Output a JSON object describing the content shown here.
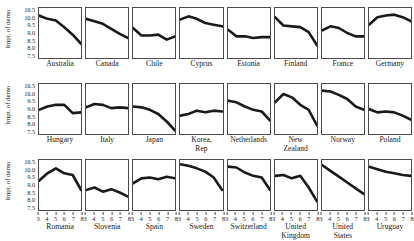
{
  "figure": {
    "axis": {
      "ylabel": "Impt. of demo",
      "ytick_labels": [
        "10.5",
        "10.0",
        "9.5",
        "9.0",
        "8.5",
        "8.0",
        "7.5"
      ],
      "yrange": [
        7.5,
        10.5
      ],
      "xtick_labels": [
        "3",
        "4",
        "5",
        "6",
        "7",
        "8"
      ],
      "xrange": [
        3,
        8
      ],
      "line_color": "#1a1a1a",
      "frame_color": "#4a4a4a"
    }
  },
  "chart_data": {
    "type": "line",
    "title": "",
    "xlabel": "",
    "ylabel": "Impt. of demo",
    "xlim": [
      3,
      8
    ],
    "ylim": [
      7.5,
      10.5
    ],
    "grid": false,
    "legend": "none",
    "x": [
      3,
      4,
      5,
      6,
      7,
      8
    ],
    "panel_layout": {
      "rows": 3,
      "cols": 8
    },
    "panels": [
      {
        "label": "Australia",
        "row": 1,
        "col": 1,
        "values": [
          10.05,
          9.85,
          9.75,
          9.35,
          8.9,
          8.35
        ]
      },
      {
        "label": "Canada",
        "row": 1,
        "col": 2,
        "values": [
          9.85,
          9.7,
          9.55,
          9.25,
          8.95,
          8.7
        ]
      },
      {
        "label": "Chile",
        "row": 1,
        "col": 3,
        "values": [
          9.3,
          8.85,
          8.85,
          8.9,
          8.6,
          8.8
        ]
      },
      {
        "label": "Cyprus",
        "row": 1,
        "col": 4,
        "values": [
          9.8,
          10.0,
          9.85,
          9.6,
          9.5,
          9.4
        ]
      },
      {
        "label": "Estonia",
        "row": 1,
        "col": 5,
        "values": [
          9.2,
          8.8,
          8.8,
          8.7,
          8.75,
          8.75
        ]
      },
      {
        "label": "Finland",
        "row": 1,
        "col": 6,
        "values": [
          9.95,
          9.45,
          9.4,
          9.35,
          9.05,
          8.25
        ]
      },
      {
        "label": "France",
        "row": 1,
        "col": 7,
        "values": [
          9.15,
          9.4,
          9.3,
          9.0,
          8.8,
          8.8
        ]
      },
      {
        "label": "Germany",
        "row": 1,
        "col": 8,
        "values": [
          9.5,
          9.95,
          10.05,
          10.1,
          9.95,
          9.7
        ]
      },
      {
        "label": "Hungary",
        "row": 2,
        "col": 1,
        "values": [
          8.95,
          9.15,
          9.25,
          9.25,
          8.75,
          8.8
        ]
      },
      {
        "label": "Italy",
        "row": 2,
        "col": 2,
        "values": [
          9.1,
          9.3,
          9.25,
          9.05,
          9.1,
          9.05
        ]
      },
      {
        "label": "Japan",
        "row": 2,
        "col": 3,
        "values": [
          9.15,
          9.1,
          8.95,
          8.7,
          8.25,
          7.7
        ]
      },
      {
        "label": "Korea,\nRep",
        "row": 2,
        "col": 4,
        "values": [
          8.6,
          8.7,
          8.9,
          8.8,
          8.9,
          8.85
        ]
      },
      {
        "label": "Netherlands",
        "row": 2,
        "col": 5,
        "values": [
          9.5,
          9.4,
          9.15,
          8.95,
          8.85,
          8.3
        ]
      },
      {
        "label": "New\nZealand",
        "row": 2,
        "col": 6,
        "values": [
          9.4,
          9.9,
          9.7,
          9.25,
          8.95,
          8.0
        ]
      },
      {
        "label": "Norway",
        "row": 2,
        "col": 7,
        "values": [
          10.1,
          10.05,
          9.85,
          9.6,
          9.15,
          8.95
        ]
      },
      {
        "label": "Poland",
        "row": 2,
        "col": 8,
        "values": [
          9.0,
          8.8,
          8.85,
          8.8,
          8.6,
          8.35
        ]
      },
      {
        "label": "Romania",
        "row": 3,
        "col": 1,
        "values": [
          9.25,
          9.7,
          10.0,
          9.7,
          9.6,
          8.7
        ]
      },
      {
        "label": "Slovenia",
        "row": 3,
        "col": 2,
        "values": [
          8.7,
          8.85,
          8.6,
          8.75,
          8.55,
          8.3
        ]
      },
      {
        "label": "Spain",
        "row": 3,
        "col": 3,
        "values": [
          9.1,
          9.4,
          9.45,
          9.35,
          9.5,
          9.4
        ]
      },
      {
        "label": "Sweden",
        "row": 3,
        "col": 4,
        "values": [
          10.25,
          10.15,
          10.0,
          9.8,
          9.45,
          8.7
        ]
      },
      {
        "label": "Switzerland",
        "row": 3,
        "col": 5,
        "values": [
          10.1,
          10.05,
          9.75,
          9.55,
          9.45,
          8.7
        ]
      },
      {
        "label": "United\nKingdom",
        "row": 3,
        "col": 6,
        "values": [
          9.55,
          9.6,
          9.4,
          9.55,
          8.85,
          8.0
        ]
      },
      {
        "label": "United\nStates",
        "row": 3,
        "col": 7,
        "values": [
          10.2,
          9.85,
          9.5,
          9.15,
          8.8,
          8.45
        ]
      },
      {
        "label": "Uruguay",
        "row": 3,
        "col": 8,
        "values": [
          10.1,
          9.95,
          9.8,
          9.7,
          9.6,
          9.55
        ]
      }
    ]
  }
}
